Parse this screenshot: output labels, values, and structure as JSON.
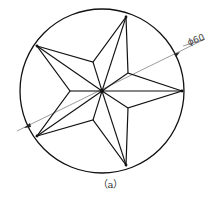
{
  "figure": {
    "caption": "（a）",
    "dimension_label": "ϕ60",
    "colors": {
      "stroke": "#111111",
      "dim_line": "#555555",
      "background": "#ffffff"
    },
    "circle": {
      "cx": 102,
      "cy": 91,
      "r": 82
    },
    "star": {
      "outer_points": [
        [
          182,
          91
        ],
        [
          126,
          17
        ],
        [
          37,
          46
        ],
        [
          37,
          136
        ],
        [
          126,
          165
        ]
      ],
      "inner_points": [
        [
          128,
          73
        ],
        [
          93,
          62
        ],
        [
          70,
          91
        ],
        [
          93,
          120
        ],
        [
          128,
          108
        ]
      ],
      "center": [
        102,
        91
      ]
    }
  }
}
